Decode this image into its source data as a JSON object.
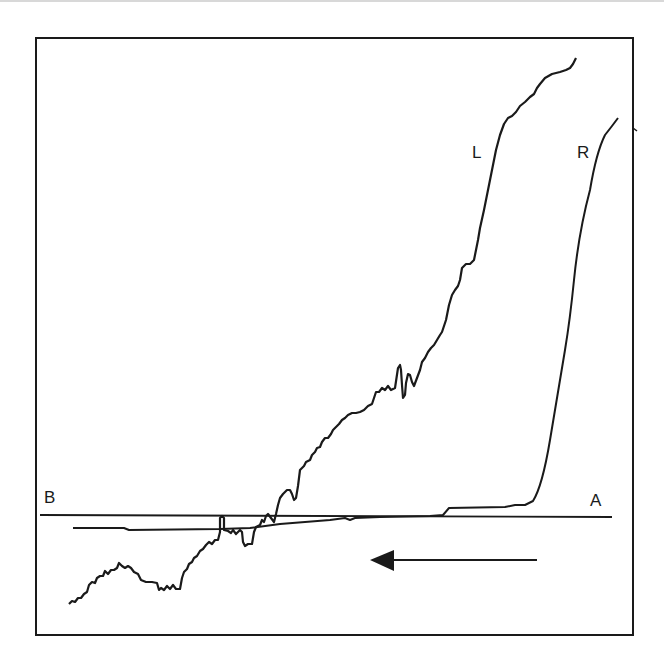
{
  "figure": {
    "labels": {
      "curve_left": "L",
      "curve_right": "R",
      "baseline_left_end": "B",
      "baseline_right_end": "A"
    },
    "arrow": {
      "direction": "left",
      "meaning": "direction of traversal from A to B"
    },
    "colors": {
      "ink": "#1a1a1a",
      "background": "#ffffff"
    },
    "curves": [
      {
        "name": "L",
        "description": "irregular trace rising steeply toward the upper right, starting below baseline at lower left"
      },
      {
        "name": "R",
        "description": "trace flat near baseline, rising sharply near the right end"
      }
    ]
  }
}
